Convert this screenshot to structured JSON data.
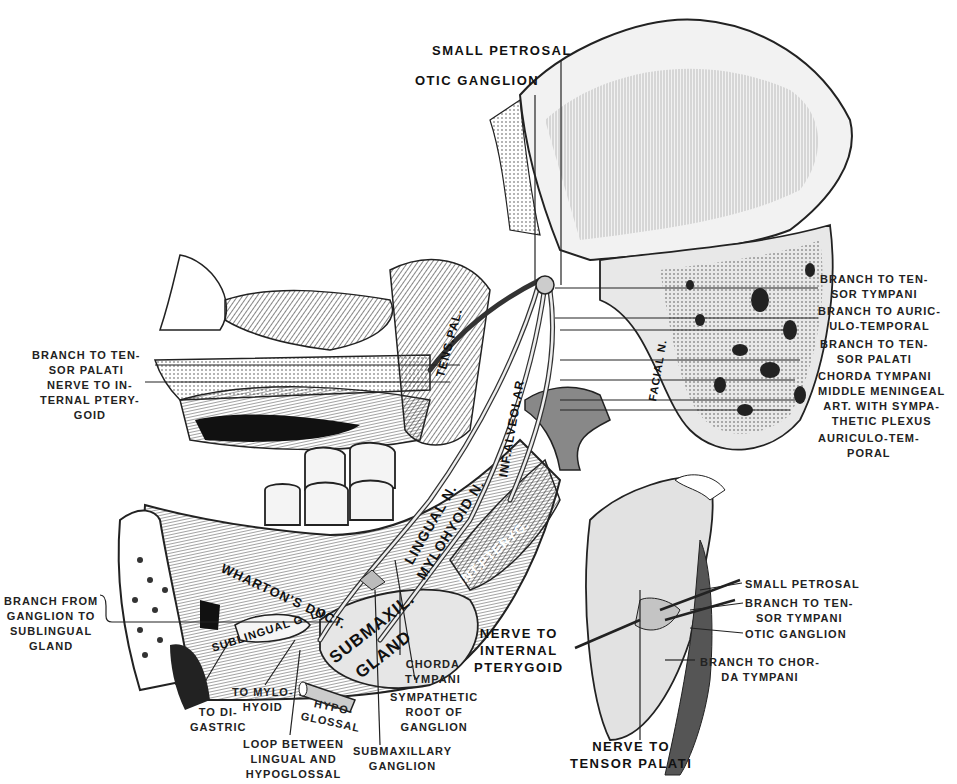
{
  "figure": {
    "colors": {
      "ink": "#1a1a1a",
      "paper": "#ffffff",
      "shade": "#b8b8b8",
      "light_shade": "#d9d9d9"
    }
  },
  "labels_top": {
    "small_petrosal": "SMALL PETROSAL",
    "otic_ganglion": "OTIC GANGLION"
  },
  "labels_right": [
    {
      "lines": [
        "BRANCH TO TEN-",
        "SOR TYMPANI"
      ]
    },
    {
      "lines": [
        "BRANCH TO AURIC-",
        "ULO-TEMPORAL"
      ]
    },
    {
      "lines": [
        "BRANCH TO TEN-",
        "SOR PALATI"
      ]
    },
    {
      "lines": [
        "CHORDA TYMPANI"
      ]
    },
    {
      "lines": [
        "MIDDLE MENINGEAL",
        "ART. WITH SYMPA-",
        "THETIC PLEXUS"
      ]
    },
    {
      "lines": [
        "AURICULO-TEM-",
        "PORAL"
      ]
    }
  ],
  "labels_left": [
    {
      "lines": [
        "BRANCH TO TEN-",
        "SOR PALATI"
      ]
    },
    {
      "lines": [
        "NERVE TO IN-",
        "TERNAL PTERY-",
        "GOID"
      ]
    },
    {
      "lines": [
        "BRANCH FROM",
        "GANGLION TO",
        "SUBLINGUAL",
        "GLAND"
      ]
    }
  ],
  "labels_bottom": [
    {
      "lines": [
        "TO DI-",
        "GASTRIC"
      ]
    },
    {
      "lines": [
        "TO MYLO-",
        "HYOID"
      ]
    },
    {
      "lines": [
        "HYPO-",
        "GLOSSAL"
      ]
    },
    {
      "lines": [
        "LOOP BETWEEN",
        "LINGUAL AND",
        "HYPOGLOSSAL"
      ]
    },
    {
      "lines": [
        "SUBMAXILLARY",
        "GANGLION"
      ]
    },
    {
      "lines": [
        "CHORDA",
        "TYMPANI"
      ]
    },
    {
      "lines": [
        "SYMPATHETIC",
        "ROOT OF",
        "GANGLION"
      ]
    }
  ],
  "labels_inset": [
    {
      "lines": [
        "SMALL PETROSAL"
      ]
    },
    {
      "lines": [
        "BRANCH TO TEN-",
        "SOR TYMPANI"
      ]
    },
    {
      "lines": [
        "OTIC GANGLION"
      ]
    },
    {
      "lines": [
        "BRANCH TO CHOR-",
        "DA TYMPANI"
      ]
    },
    {
      "lines": [
        "NERVE TO",
        "INTERNAL",
        "PTERYGOID"
      ]
    },
    {
      "lines": [
        "NERVE TO",
        "TENSOR PALATI"
      ]
    }
  ],
  "in_figure_labels": {
    "tens_pal": "TENS.PAL.",
    "facial_n": "FACIAL N.",
    "inf_alveolar": "INF.ALVEOLAR",
    "lingual_n": "LINGUAL N.",
    "mylohyoid_n": "MYLOHYOID N.",
    "int_pteryg": "INT.PTERYG.",
    "whartons_duct": "WHARTON'S DUCT.",
    "sublingual_gld": "SUBLINGUAL G. LD.",
    "submaxil": "SUBMAXIL.",
    "gland": "GLAND"
  }
}
